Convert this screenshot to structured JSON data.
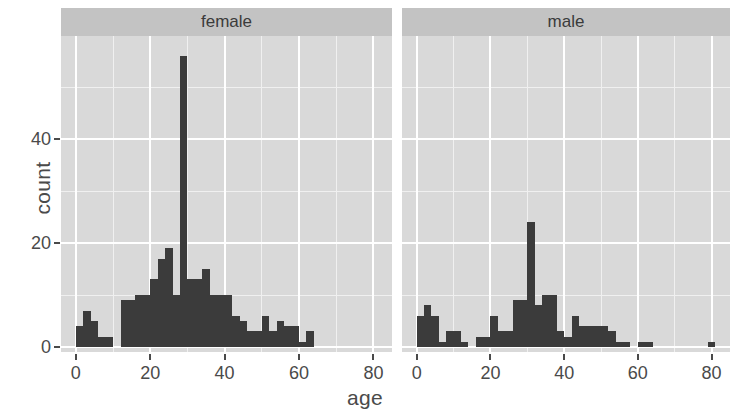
{
  "chart_data": {
    "type": "bar",
    "subtype": "histogram-faceted",
    "title": "",
    "xlabel": "age",
    "ylabel": "count",
    "xlim": [
      -4,
      85
    ],
    "ylim": [
      0,
      58
    ],
    "binwidth": 2,
    "grid": true,
    "legend": "none",
    "facet_variable": "sex",
    "facets": [
      "female",
      "male"
    ],
    "xticks": [
      0,
      20,
      40,
      60,
      80
    ],
    "xtick_labels": [
      "0",
      "20",
      "40",
      "60",
      "80"
    ],
    "yticks": [
      0,
      20,
      40
    ],
    "ytick_labels": [
      "0",
      "20",
      "40"
    ],
    "xminor": [
      10,
      30,
      50,
      70
    ],
    "yminor": [
      10,
      30,
      50
    ],
    "colors": {
      "bar_fill": "#3b3b3b",
      "panel_background": "#d9d9d9",
      "strip_background": "#c3c3c3",
      "gridline_major": "#ffffff",
      "gridline_minor": "#f0f0f0",
      "text": "#4a4a4a",
      "page_background": "#ffffff"
    },
    "series": [
      {
        "name": "female",
        "bins": [
          {
            "x0": 0,
            "x1": 2,
            "count": 4
          },
          {
            "x0": 2,
            "x1": 4,
            "count": 7
          },
          {
            "x0": 4,
            "x1": 6,
            "count": 5
          },
          {
            "x0": 6,
            "x1": 8,
            "count": 2
          },
          {
            "x0": 8,
            "x1": 10,
            "count": 2
          },
          {
            "x0": 10,
            "x1": 12,
            "count": 0
          },
          {
            "x0": 12,
            "x1": 14,
            "count": 9
          },
          {
            "x0": 14,
            "x1": 16,
            "count": 9
          },
          {
            "x0": 16,
            "x1": 18,
            "count": 10
          },
          {
            "x0": 18,
            "x1": 20,
            "count": 10
          },
          {
            "x0": 20,
            "x1": 22,
            "count": 13
          },
          {
            "x0": 22,
            "x1": 24,
            "count": 17
          },
          {
            "x0": 24,
            "x1": 26,
            "count": 19
          },
          {
            "x0": 26,
            "x1": 28,
            "count": 10
          },
          {
            "x0": 28,
            "x1": 30,
            "count": 56
          },
          {
            "x0": 30,
            "x1": 32,
            "count": 13
          },
          {
            "x0": 32,
            "x1": 34,
            "count": 13
          },
          {
            "x0": 34,
            "x1": 36,
            "count": 15
          },
          {
            "x0": 36,
            "x1": 38,
            "count": 10
          },
          {
            "x0": 38,
            "x1": 40,
            "count": 10
          },
          {
            "x0": 40,
            "x1": 42,
            "count": 10
          },
          {
            "x0": 42,
            "x1": 44,
            "count": 6
          },
          {
            "x0": 44,
            "x1": 46,
            "count": 5
          },
          {
            "x0": 46,
            "x1": 48,
            "count": 3
          },
          {
            "x0": 48,
            "x1": 50,
            "count": 3
          },
          {
            "x0": 50,
            "x1": 52,
            "count": 6
          },
          {
            "x0": 52,
            "x1": 54,
            "count": 3
          },
          {
            "x0": 54,
            "x1": 56,
            "count": 5
          },
          {
            "x0": 56,
            "x1": 58,
            "count": 4
          },
          {
            "x0": 58,
            "x1": 60,
            "count": 4
          },
          {
            "x0": 60,
            "x1": 62,
            "count": 1
          },
          {
            "x0": 62,
            "x1": 64,
            "count": 3
          }
        ]
      },
      {
        "name": "male",
        "bins": [
          {
            "x0": 0,
            "x1": 2,
            "count": 6
          },
          {
            "x0": 2,
            "x1": 4,
            "count": 8
          },
          {
            "x0": 4,
            "x1": 6,
            "count": 6
          },
          {
            "x0": 6,
            "x1": 8,
            "count": 1
          },
          {
            "x0": 8,
            "x1": 10,
            "count": 3
          },
          {
            "x0": 10,
            "x1": 12,
            "count": 3
          },
          {
            "x0": 12,
            "x1": 14,
            "count": 1
          },
          {
            "x0": 14,
            "x1": 16,
            "count": 0
          },
          {
            "x0": 16,
            "x1": 18,
            "count": 2
          },
          {
            "x0": 18,
            "x1": 20,
            "count": 2
          },
          {
            "x0": 20,
            "x1": 22,
            "count": 6
          },
          {
            "x0": 22,
            "x1": 24,
            "count": 3
          },
          {
            "x0": 24,
            "x1": 26,
            "count": 3
          },
          {
            "x0": 26,
            "x1": 28,
            "count": 9
          },
          {
            "x0": 28,
            "x1": 30,
            "count": 9
          },
          {
            "x0": 30,
            "x1": 32,
            "count": 24
          },
          {
            "x0": 32,
            "x1": 34,
            "count": 8
          },
          {
            "x0": 34,
            "x1": 36,
            "count": 10
          },
          {
            "x0": 36,
            "x1": 38,
            "count": 10
          },
          {
            "x0": 38,
            "x1": 40,
            "count": 3
          },
          {
            "x0": 40,
            "x1": 42,
            "count": 2
          },
          {
            "x0": 42,
            "x1": 44,
            "count": 6
          },
          {
            "x0": 44,
            "x1": 46,
            "count": 4
          },
          {
            "x0": 46,
            "x1": 48,
            "count": 4
          },
          {
            "x0": 48,
            "x1": 50,
            "count": 4
          },
          {
            "x0": 50,
            "x1": 52,
            "count": 4
          },
          {
            "x0": 52,
            "x1": 54,
            "count": 3
          },
          {
            "x0": 54,
            "x1": 56,
            "count": 1
          },
          {
            "x0": 56,
            "x1": 58,
            "count": 1
          },
          {
            "x0": 60,
            "x1": 64,
            "count": 1
          },
          {
            "x0": 79,
            "x1": 81,
            "count": 1
          }
        ]
      }
    ]
  }
}
